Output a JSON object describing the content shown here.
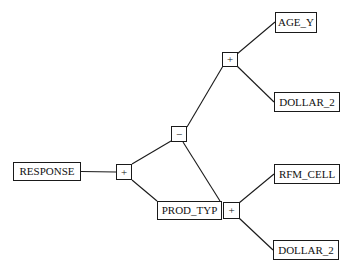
{
  "diagram": {
    "type": "path-diagram",
    "nodes": [
      {
        "id": "response",
        "label": "RESPONSE"
      },
      {
        "id": "prod_typ",
        "label": "PROD_TYP"
      },
      {
        "id": "age_y",
        "label": "AGE_Y"
      },
      {
        "id": "dollar_2_upper",
        "label": "DOLLAR_2"
      },
      {
        "id": "rfm_cell",
        "label": "RFM_CELL"
      },
      {
        "id": "dollar_2_lower",
        "label": "DOLLAR_2"
      }
    ],
    "operators": [
      {
        "id": "op_root",
        "sign": "+"
      },
      {
        "id": "op_mid",
        "sign": "−"
      },
      {
        "id": "op_upper",
        "sign": "+"
      },
      {
        "id": "op_lower",
        "sign": "+"
      }
    ],
    "edges": [
      [
        "response",
        "op_root"
      ],
      [
        "op_root",
        "op_mid"
      ],
      [
        "op_root",
        "prod_typ"
      ],
      [
        "op_mid",
        "op_upper"
      ],
      [
        "op_mid",
        "op_lower"
      ],
      [
        "op_upper",
        "age_y"
      ],
      [
        "op_upper",
        "dollar_2_upper"
      ],
      [
        "op_lower",
        "rfm_cell"
      ],
      [
        "op_lower",
        "dollar_2_lower"
      ]
    ],
    "colors": {
      "stroke": "#1a1a1a",
      "background": "#ffffff",
      "text": "#111111"
    }
  }
}
